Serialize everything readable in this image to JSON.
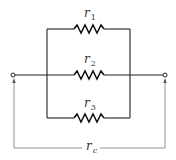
{
  "diagram": {
    "resistors": [
      {
        "name": "r",
        "subscript": "1"
      },
      {
        "name": "r",
        "subscript": "2"
      },
      {
        "name": "r",
        "subscript": "3"
      }
    ],
    "equivalent": {
      "name": "r",
      "subscript": "c"
    },
    "colors": {
      "wire": "#222222",
      "measure": "#888888",
      "text": "#333333"
    }
  }
}
